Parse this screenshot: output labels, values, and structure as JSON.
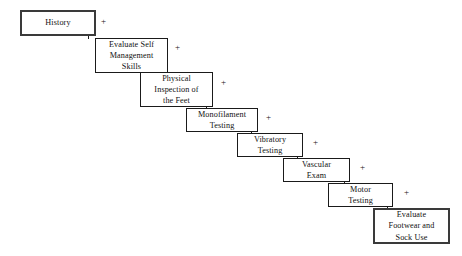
{
  "diagram": {
    "type": "cascading-staircase-flowchart",
    "background_color": "#ffffff",
    "line_color": "#1a1a1a",
    "text_color": "#111111",
    "connector_symbol": "+",
    "steps": [
      {
        "index": 1,
        "label": "History",
        "plus": "+",
        "emphasis": true,
        "box": {
          "x": 20,
          "y": 10,
          "w": 76,
          "h": 26
        },
        "plus_pos": {
          "x": 101,
          "y": 17
        },
        "connector": {
          "x": 88,
          "y1": 36,
          "y2": 39
        }
      },
      {
        "index": 2,
        "label": "Evaluate Self\nManagement\nSkills",
        "plus": "+",
        "emphasis": false,
        "box": {
          "x": 95,
          "y": 38,
          "w": 73,
          "h": 35
        },
        "plus_pos": {
          "x": 175,
          "y": 43
        },
        "connector": {
          "x": 161,
          "y1": 73,
          "y2": 76
        }
      },
      {
        "index": 3,
        "label": "Physical\nInspection of\nthe Feet",
        "plus": "+",
        "emphasis": false,
        "box": {
          "x": 140,
          "y": 72,
          "w": 73,
          "h": 35
        },
        "plus_pos": {
          "x": 221,
          "y": 78
        },
        "connector": {
          "x": 206,
          "y1": 107,
          "y2": 110
        }
      },
      {
        "index": 4,
        "label": "Monofilament\nTesting",
        "plus": "+",
        "emphasis": false,
        "box": {
          "x": 186,
          "y": 108,
          "w": 72,
          "h": 24
        },
        "plus_pos": {
          "x": 266,
          "y": 113
        },
        "connector": {
          "x": 251,
          "y1": 132,
          "y2": 135
        }
      },
      {
        "index": 5,
        "label": "Vibratory\nTesting",
        "plus": "+",
        "emphasis": false,
        "box": {
          "x": 237,
          "y": 133,
          "w": 66,
          "h": 24
        },
        "plus_pos": {
          "x": 313,
          "y": 138
        },
        "connector": {
          "x": 297,
          "y1": 157,
          "y2": 160
        }
      },
      {
        "index": 6,
        "label": "Vascular\nExam",
        "plus": "+",
        "emphasis": false,
        "box": {
          "x": 283,
          "y": 158,
          "w": 67,
          "h": 24
        },
        "plus_pos": {
          "x": 360,
          "y": 163
        },
        "connector": {
          "x": 344,
          "y1": 182,
          "y2": 185
        }
      },
      {
        "index": 7,
        "label": "Motor\nTesting",
        "plus": "+",
        "emphasis": false,
        "box": {
          "x": 328,
          "y": 183,
          "w": 65,
          "h": 24
        },
        "plus_pos": {
          "x": 404,
          "y": 188
        },
        "connector": {
          "x": 387,
          "y1": 207,
          "y2": 210
        }
      },
      {
        "index": 8,
        "label": "Evaluate\nFootwear and\nSock Use",
        "plus": "",
        "emphasis": true,
        "box": {
          "x": 373,
          "y": 208,
          "w": 77,
          "h": 36
        },
        "plus_pos": null,
        "connector": null
      }
    ]
  }
}
